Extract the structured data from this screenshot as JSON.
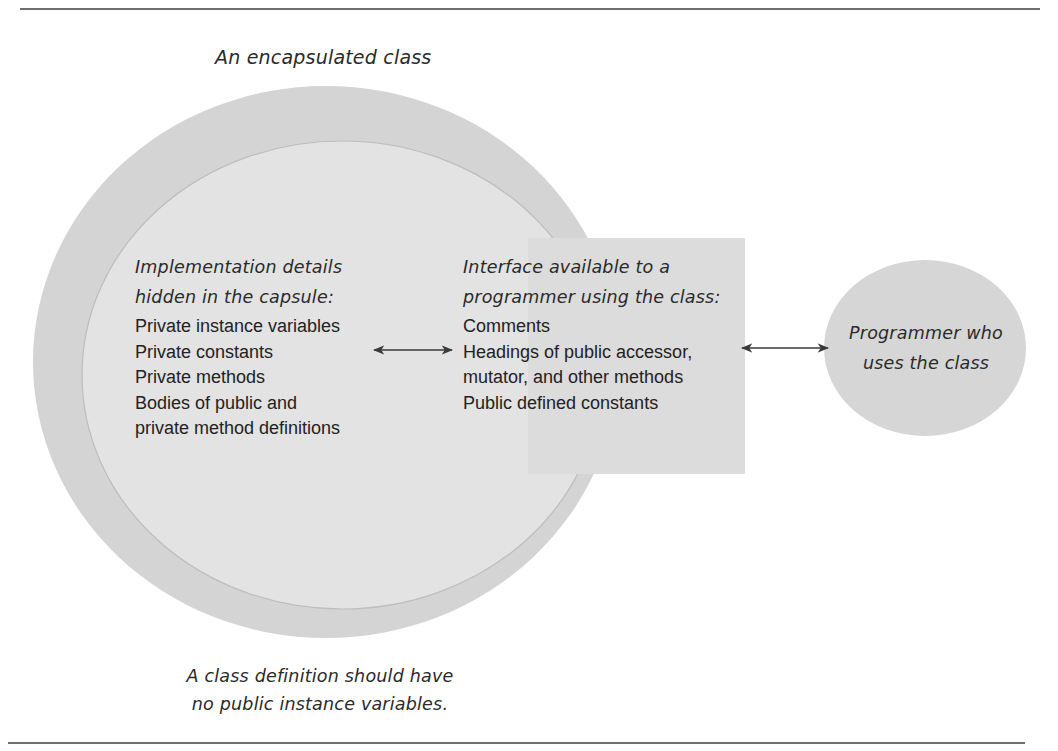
{
  "diagram": {
    "title": "An encapsulated class",
    "colors": {
      "outer_circle": "#d4d4d4",
      "inner_circle": "#e3e3e3",
      "interface_box": "#dcdcdc",
      "programmer_circle": "#d6d6d6",
      "arrow": "#3a3a3a",
      "rule": "#6e6e6e"
    },
    "implementation": {
      "heading": [
        "Implementation details",
        "hidden in the capsule:"
      ],
      "items": [
        "Private instance variables",
        "Private constants",
        "Private methods",
        "Bodies of public and",
        "private method definitions"
      ]
    },
    "interface": {
      "heading": [
        "Interface available to a",
        "programmer using the class:"
      ],
      "items": [
        "Comments",
        "Headings of public accessor,",
        "mutator, and other methods",
        "Public defined constants"
      ]
    },
    "programmer": {
      "label": [
        "Programmer who",
        "uses the class"
      ]
    },
    "caption": [
      "A class definition should have",
      "no public instance variables."
    ],
    "arrows": [
      {
        "name": "implementation-interface-arrow",
        "direction": "bidirectional"
      },
      {
        "name": "interface-programmer-arrow",
        "direction": "bidirectional"
      }
    ]
  }
}
